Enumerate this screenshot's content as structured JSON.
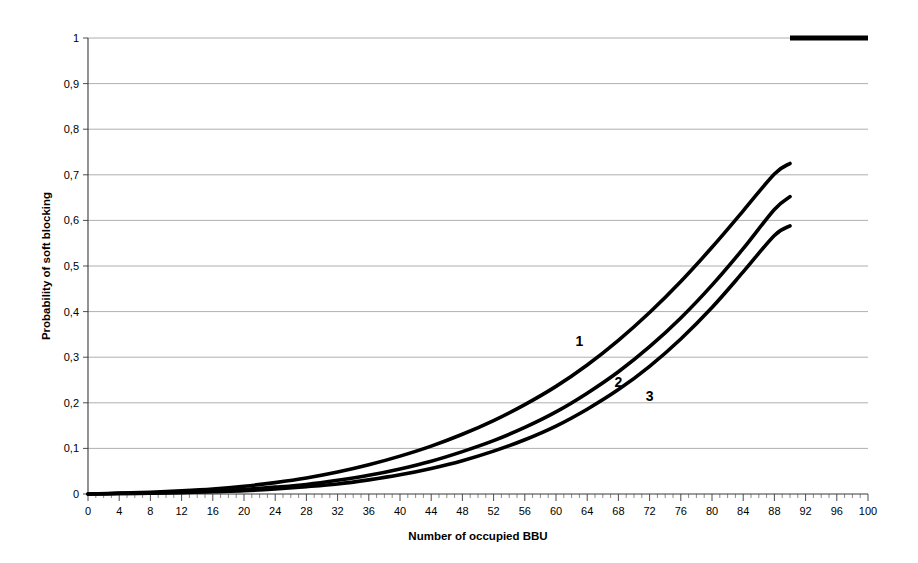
{
  "chart_data": {
    "type": "line",
    "title": "",
    "xlabel": "Number of occupied BBU",
    "ylabel": "Probability of soft blocking",
    "xlim": [
      0,
      100
    ],
    "ylim": [
      0,
      1
    ],
    "grid": "horizontal",
    "legend_position": "inline-labels",
    "x_ticks": [
      0,
      4,
      8,
      12,
      16,
      20,
      24,
      28,
      32,
      36,
      40,
      44,
      48,
      52,
      56,
      60,
      64,
      68,
      72,
      76,
      80,
      84,
      88,
      92,
      96,
      100
    ],
    "x_tick_labels": [
      "0",
      "4",
      "8",
      "12",
      "16",
      "20",
      "24",
      "28",
      "32",
      "36",
      "40",
      "44",
      "48",
      "52",
      "56",
      "60",
      "64",
      "68",
      "72",
      "76",
      "80",
      "84",
      "88",
      "92",
      "96",
      "100"
    ],
    "x_minor_tick_step": 1,
    "y_ticks": [
      0,
      0.1,
      0.2,
      0.3,
      0.4,
      0.5,
      0.6,
      0.7,
      0.8,
      0.9,
      1
    ],
    "y_tick_labels": [
      "0",
      "0,1",
      "0,2",
      "0,3",
      "0,4",
      "0,5",
      "0,6",
      "0,7",
      "0,8",
      "0,9",
      "1"
    ],
    "decimal_separator": ",",
    "curve_color": "#000000",
    "gridline_color": "#9a9a9a",
    "series": [
      {
        "name": "1",
        "label": "1",
        "label_x": 63,
        "label_y": 0.325,
        "x": [
          0,
          4,
          8,
          12,
          16,
          20,
          24,
          28,
          32,
          36,
          40,
          44,
          48,
          52,
          56,
          60,
          64,
          68,
          72,
          76,
          80,
          84,
          88,
          90
        ],
        "values": [
          0.0,
          0.002,
          0.004,
          0.007,
          0.011,
          0.017,
          0.025,
          0.035,
          0.048,
          0.064,
          0.083,
          0.105,
          0.131,
          0.161,
          0.196,
          0.236,
          0.283,
          0.337,
          0.398,
          0.466,
          0.541,
          0.621,
          0.702,
          0.725
        ]
      },
      {
        "name": "2",
        "label": "2",
        "label_x": 68,
        "label_y": 0.235,
        "x": [
          0,
          4,
          8,
          12,
          16,
          20,
          24,
          28,
          32,
          36,
          40,
          44,
          48,
          52,
          56,
          60,
          64,
          68,
          72,
          76,
          80,
          84,
          88,
          90
        ],
        "values": [
          0.0,
          0.001,
          0.002,
          0.004,
          0.006,
          0.01,
          0.015,
          0.021,
          0.03,
          0.041,
          0.055,
          0.072,
          0.093,
          0.117,
          0.146,
          0.18,
          0.221,
          0.268,
          0.323,
          0.386,
          0.458,
          0.538,
          0.624,
          0.652
        ]
      },
      {
        "name": "3",
        "label": "3",
        "label_x": 72,
        "label_y": 0.205,
        "x": [
          0,
          4,
          8,
          12,
          16,
          20,
          24,
          28,
          32,
          36,
          40,
          44,
          48,
          52,
          56,
          60,
          64,
          68,
          72,
          76,
          80,
          84,
          88,
          90
        ],
        "values": [
          0.0,
          0.001,
          0.002,
          0.003,
          0.005,
          0.007,
          0.011,
          0.016,
          0.022,
          0.031,
          0.042,
          0.056,
          0.073,
          0.094,
          0.119,
          0.149,
          0.186,
          0.229,
          0.28,
          0.34,
          0.409,
          0.487,
          0.567,
          0.588
        ]
      }
    ],
    "annotations": [
      {
        "name": "saturation-segment",
        "description": "thick horizontal segment at probability 1",
        "x_start": 90,
        "x_end": 100,
        "y": 1.0
      }
    ]
  }
}
